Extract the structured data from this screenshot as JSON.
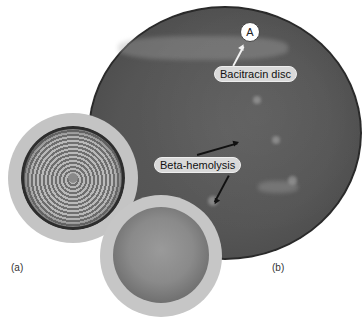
{
  "figure": {
    "panel_a_label": "(a)",
    "panel_b_label": "(b)",
    "disc_marker": "A",
    "callouts": {
      "bacitracin": "Bacitracin disc",
      "beta_hemolysis": "Beta-hemolysis"
    }
  }
}
